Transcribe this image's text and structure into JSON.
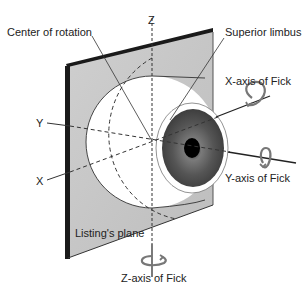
{
  "diagram": {
    "labels": {
      "center_of_rotation": "Center of rotation",
      "superior_limbus": "Superior limbus",
      "x_axis_fick": "X-axis of Fick",
      "y_axis_fick": "Y-axis of Fick",
      "z_axis_fick": "Z-axis of Fick",
      "listings_plane": "Listing's plane",
      "axis_z": "Z",
      "axis_y": "Y",
      "axis_x": "X"
    },
    "colors": {
      "plane_fill": "#c8c8c8",
      "plane_edge": "#1a1a1a",
      "sclera": "#ffffff",
      "iris": "#4a4a4a",
      "pupil": "#000000",
      "line": "#222222",
      "rotation_arrow": "#777777"
    },
    "nodes": [
      {
        "id": "listings-plane",
        "label": "Listing's plane"
      },
      {
        "id": "eyeball",
        "label": "Eye"
      },
      {
        "id": "center",
        "label": "Center of rotation"
      },
      {
        "id": "limbus",
        "label": "Superior limbus"
      }
    ],
    "edges": [
      {
        "from": "center",
        "to": "x_axis",
        "label": "X-axis of Fick"
      },
      {
        "from": "center",
        "to": "y_axis",
        "label": "Y-axis of Fick"
      },
      {
        "from": "center",
        "to": "z_axis",
        "label": "Z-axis of Fick"
      }
    ]
  }
}
